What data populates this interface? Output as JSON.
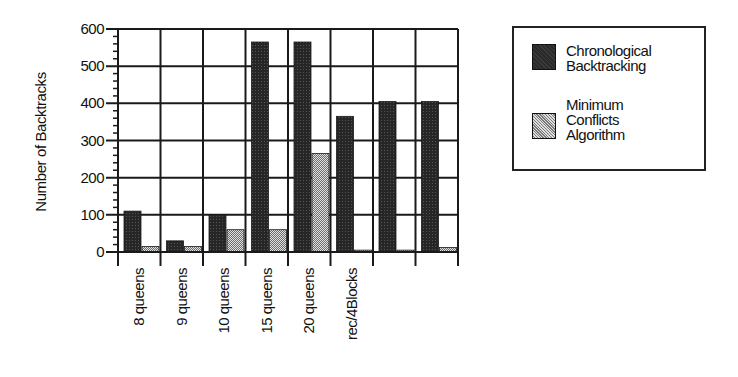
{
  "chart_data": {
    "type": "bar",
    "title": "",
    "xlabel": "",
    "ylabel": "Number of Backtracks",
    "ylim": [
      0,
      600
    ],
    "yticks": [
      0,
      100,
      200,
      300,
      400,
      500,
      600
    ],
    "grid": true,
    "legend_position": "right",
    "categories": [
      "8 queens",
      "9 queens",
      "10 queens",
      "15 queens",
      "20 queens",
      "rec/4Blocks",
      "",
      ""
    ],
    "series": [
      {
        "name": "Chronological Backtracking",
        "color": "#2a2a2a",
        "values": [
          110,
          30,
          100,
          565,
          565,
          365,
          405,
          405
        ]
      },
      {
        "name": "Minimum Conflicts Algorithm",
        "color": "#9a9a9a",
        "values": [
          15,
          15,
          60,
          60,
          265,
          5,
          5,
          12
        ]
      }
    ]
  },
  "legend": {
    "items": [
      {
        "label": "Chronological\nBacktracking"
      },
      {
        "label": "Minimum\nConflicts\nAlgorithm"
      }
    ]
  }
}
